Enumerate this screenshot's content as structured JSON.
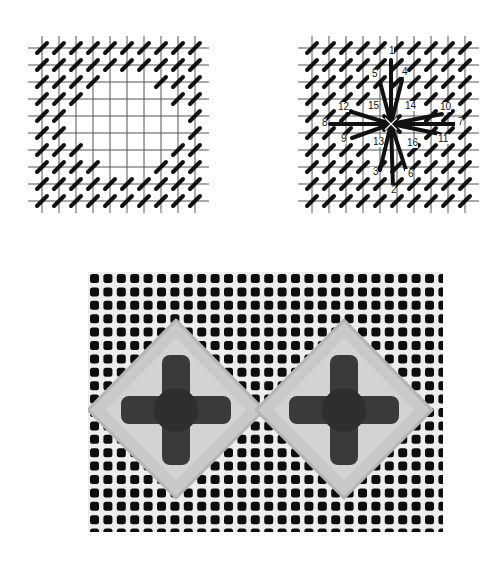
{
  "figure": {
    "panels": [
      {
        "id": "left",
        "description": "Canvas grid with tent stitches surrounding a 4x4 empty square opening"
      },
      {
        "id": "right",
        "description": "Canvas grid with tent stitches and a large star/eyelet stitch with numbered needle positions"
      },
      {
        "id": "photo",
        "description": "Photograph of stitched canvas showing two diamond motifs with dark cross centers"
      }
    ],
    "grid": {
      "lines": 10,
      "spacing": 17
    },
    "star_labels": [
      {
        "n": "1",
        "x": 97,
        "y": 24
      },
      {
        "n": "2",
        "x": 99,
        "y": 163
      },
      {
        "n": "3",
        "x": 81,
        "y": 145
      },
      {
        "n": "4",
        "x": 110,
        "y": 45
      },
      {
        "n": "5",
        "x": 80,
        "y": 47
      },
      {
        "n": "6",
        "x": 116,
        "y": 147
      },
      {
        "n": "7",
        "x": 166,
        "y": 95
      },
      {
        "n": "8",
        "x": 30,
        "y": 96
      },
      {
        "n": "9",
        "x": 49,
        "y": 112
      },
      {
        "n": "10",
        "x": 150,
        "y": 80
      },
      {
        "n": "11",
        "x": 148,
        "y": 112
      },
      {
        "n": "12",
        "x": 48,
        "y": 80
      },
      {
        "n": "13",
        "x": 83,
        "y": 115
      },
      {
        "n": "14",
        "x": 115,
        "y": 79
      },
      {
        "n": "15",
        "x": 78,
        "y": 79
      },
      {
        "n": "16",
        "x": 117,
        "y": 116
      }
    ],
    "colors": {
      "ink": "#111111",
      "grid": "#555555",
      "photo_bg": "#ededed",
      "photo_hole": "#0d0d0d",
      "wool_light": "#c9c9c9",
      "wool_dark": "#3a3a3a"
    }
  }
}
